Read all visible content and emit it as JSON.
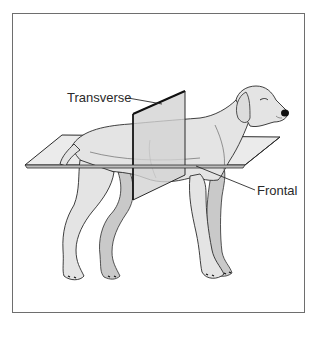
{
  "figure": {
    "labels": {
      "transverse": "Transverse",
      "frontal": "Frontal"
    },
    "colors": {
      "outline": "#2b2b2b",
      "body_fill": "#e4e4e4",
      "shadow_fill": "#c9c9c9",
      "plane_fill": "#d6d6d6",
      "frame_border": "#6e6e6e"
    }
  }
}
